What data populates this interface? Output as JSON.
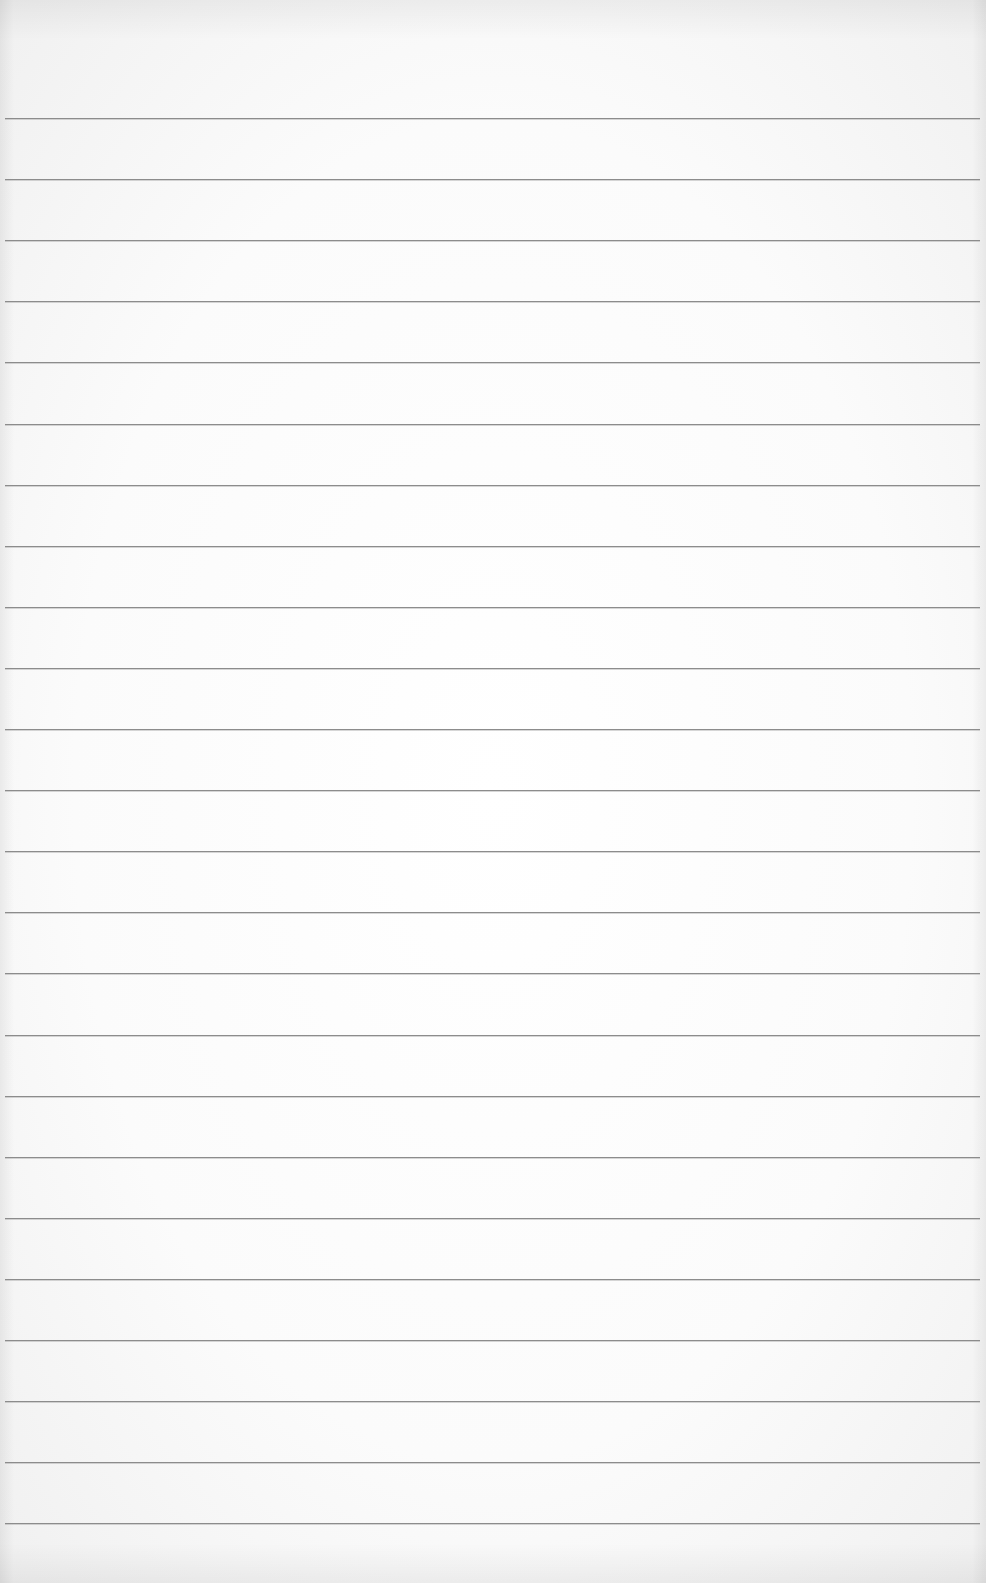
{
  "paper": {
    "type": "lined-paper",
    "background_color": "#fbfbfb",
    "line_color": "#8c8c8c",
    "line_count": 24,
    "first_line_y": 118,
    "line_spacing": 61.1,
    "line_left": 5,
    "line_right_inset": 6
  }
}
